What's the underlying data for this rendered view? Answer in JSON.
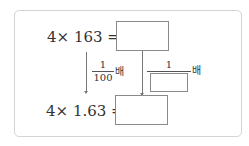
{
  "problem": {
    "top_expression": "4× 163 =",
    "bottom_expression": "4× 1.63 =",
    "left_factor": {
      "numerator": "1",
      "denominator": "100",
      "suffix": "배"
    },
    "right_factor": {
      "numerator": "1",
      "denominator": "",
      "suffix": "배"
    },
    "answers": {
      "top": "",
      "bottom": "",
      "denominator": ""
    }
  }
}
